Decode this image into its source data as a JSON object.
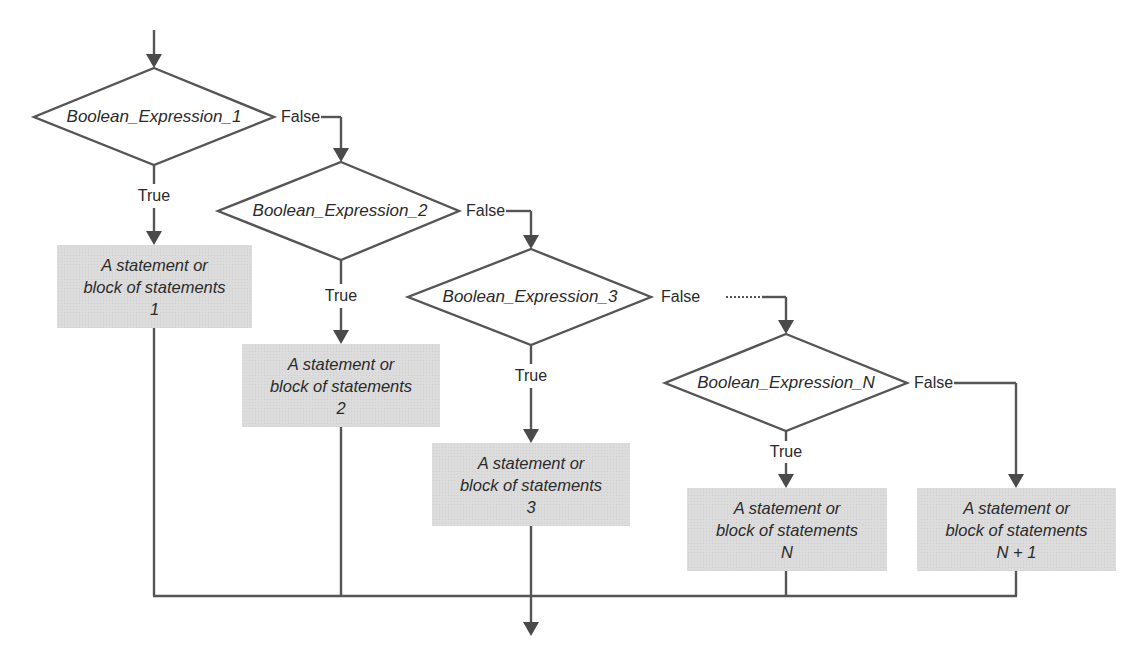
{
  "diagram": {
    "type": "flowchart",
    "decisions": [
      {
        "id": "d1",
        "label": "Boolean_Expression_1",
        "true_label": "True",
        "false_label": "False"
      },
      {
        "id": "d2",
        "label": "Boolean_Expression_2",
        "true_label": "True",
        "false_label": "False"
      },
      {
        "id": "d3",
        "label": "Boolean_Expression_3",
        "true_label": "True",
        "false_label": "False"
      },
      {
        "id": "dN",
        "label": "Boolean_Expression_N",
        "true_label": "True",
        "false_label": "False"
      }
    ],
    "blocks": [
      {
        "id": "b1",
        "line1": "A statement or",
        "line2": "block of statements",
        "line3": "1"
      },
      {
        "id": "b2",
        "line1": "A statement or",
        "line2": "block of statements",
        "line3": "2"
      },
      {
        "id": "b3",
        "line1": "A statement or",
        "line2": "block of statements",
        "line3": "3"
      },
      {
        "id": "bN",
        "line1": "A statement or",
        "line2": "block of statements",
        "line3": "N"
      },
      {
        "id": "bN1",
        "line1": "A statement or",
        "line2": "block of statements",
        "line3": "N + 1"
      }
    ],
    "colors": {
      "line": "#555555",
      "block_fill": "#dcdcdc",
      "background": "#ffffff"
    }
  }
}
